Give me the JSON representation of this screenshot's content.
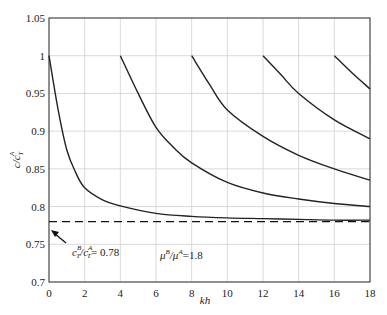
{
  "chart_data": {
    "type": "line",
    "title": "",
    "xlabel": "kh",
    "ylabel": "c/c_T^A",
    "xlim": [
      0,
      18
    ],
    "ylim": [
      0.7,
      1.05
    ],
    "grid": true,
    "xticks": [
      "0",
      "2",
      "4",
      "6",
      "8",
      "10",
      "12",
      "14",
      "16",
      "18"
    ],
    "yticks": [
      "0.7",
      "0.75",
      "0.8",
      "0.85",
      "0.9",
      "0.95",
      "1",
      "1.05"
    ],
    "series": [
      {
        "name": "mode 1",
        "x": [
          0,
          0.5,
          1,
          1.5,
          2,
          3,
          4,
          6,
          8,
          10,
          12,
          14,
          16,
          18
        ],
        "y": [
          1,
          0.93,
          0.875,
          0.845,
          0.825,
          0.809,
          0.801,
          0.791,
          0.787,
          0.785,
          0.784,
          0.783,
          0.782,
          0.782
        ]
      },
      {
        "name": "mode 2",
        "x": [
          4,
          5,
          6,
          7,
          8,
          10,
          12,
          14,
          16,
          18
        ],
        "y": [
          1,
          0.95,
          0.905,
          0.878,
          0.858,
          0.832,
          0.818,
          0.81,
          0.804,
          0.8
        ]
      },
      {
        "name": "mode 3",
        "x": [
          8,
          9,
          10,
          12,
          14,
          16,
          18
        ],
        "y": [
          1,
          0.962,
          0.928,
          0.893,
          0.868,
          0.85,
          0.835
        ]
      },
      {
        "name": "mode 4",
        "x": [
          12,
          13,
          14,
          16,
          18
        ],
        "y": [
          1,
          0.975,
          0.95,
          0.915,
          0.89
        ]
      },
      {
        "name": "mode 5",
        "x": [
          16,
          17,
          18
        ],
        "y": [
          1,
          0.977,
          0.956
        ]
      }
    ],
    "reference_line": {
      "y": 0.78,
      "style": "dashed",
      "label": "c_T^B/c_T^A = 0.78"
    },
    "annotations": [
      {
        "text": "c_T^B/c_T^A = 0.78",
        "x": 2,
        "y": 0.755
      },
      {
        "text": "μ^B/μ^A = 1.8",
        "x": 8,
        "y": 0.745
      }
    ]
  },
  "labels": {
    "xlabel": "kh",
    "ylabel_main": "c/c",
    "ylabel_sub": "T",
    "ylabel_sup": "A",
    "ratio_c_prefix": "c",
    "ratio_c_B": "B",
    "ratio_c_T": "T",
    "ratio_c_mid": "/c",
    "ratio_c_A": "A",
    "ratio_c_T2": "T",
    "ratio_c_value": "= 0.78",
    "mu_text": "μ",
    "mu_B": "B",
    "mu_mid": "/μ",
    "mu_A": "A",
    "mu_value": "=1.8"
  }
}
